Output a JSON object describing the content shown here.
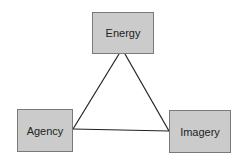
{
  "diagram": {
    "type": "triangle-relationship",
    "nodes": [
      {
        "id": "energy",
        "label": "Energy"
      },
      {
        "id": "agency",
        "label": "Agency"
      },
      {
        "id": "imagery",
        "label": "Imagery"
      }
    ],
    "edges": [
      {
        "from": "energy",
        "to": "agency"
      },
      {
        "from": "energy",
        "to": "imagery"
      },
      {
        "from": "agency",
        "to": "imagery"
      }
    ],
    "colors": {
      "node_fill": "#cbcbcb",
      "node_border": "#7a7a7a",
      "edge": "#222222",
      "background": "#ffffff"
    }
  }
}
